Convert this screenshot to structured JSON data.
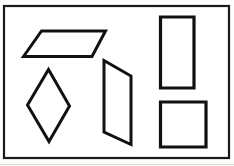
{
  "figure": {
    "background_color": "#fdfdfb",
    "paper_color": "#ffffff",
    "stroke_color": "#111111",
    "frame_stroke_color": "#1a1a1a",
    "canvas": {
      "width": 234,
      "height": 166
    },
    "frame": {
      "name": "border-frame",
      "x": 4,
      "y": 6,
      "width": 225,
      "height": 152,
      "stroke_width": 2.2
    },
    "shapes": [
      {
        "id": "parallelogram",
        "label": "Parallelogram",
        "stroke_width": 3.0,
        "points": "23.5,56.5 41.5,31.0 105.5,31.0 92.0,56.5"
      },
      {
        "id": "rhombus",
        "label": "Rhombus",
        "stroke_width": 3.0,
        "points": "48.5,69.5 69.5,106.0 49.0,141.5 27.5,105.0"
      },
      {
        "id": "slanted-quadrilateral",
        "label": "Slanted quadrilateral",
        "stroke_width": 3.0,
        "points": "104.0,60.5 131.0,76.0 131.0,144.5 104.0,132.0"
      },
      {
        "id": "tall-rectangle",
        "label": "Tall rectangle",
        "stroke_width": 3.2,
        "points": "160.5,17.0 194.0,17.0 194.0,88.0 160.5,88.0"
      },
      {
        "id": "square",
        "label": "Square",
        "stroke_width": 3.2,
        "points": "160.5,102.0 206.0,102.0 206.0,147.0 160.5,147.0"
      }
    ]
  },
  "chart_data": {
    "type": "diagram",
    "shape_count": 5,
    "shapes": [
      {
        "name": "parallelogram",
        "sides": 4,
        "vertices": [
          [
            23.5,
            56.5
          ],
          [
            41.5,
            31.0
          ],
          [
            105.5,
            31.0
          ],
          [
            92.0,
            56.5
          ]
        ]
      },
      {
        "name": "rhombus",
        "sides": 4,
        "vertices": [
          [
            48.5,
            69.5
          ],
          [
            69.5,
            106.0
          ],
          [
            49.0,
            141.5
          ],
          [
            27.5,
            105.0
          ]
        ]
      },
      {
        "name": "slanted-quadrilateral",
        "sides": 4,
        "vertices": [
          [
            104.0,
            60.5
          ],
          [
            131.0,
            76.0
          ],
          [
            131.0,
            144.5
          ],
          [
            104.0,
            132.0
          ]
        ]
      },
      {
        "name": "tall-rectangle",
        "sides": 4,
        "vertices": [
          [
            160.5,
            17.0
          ],
          [
            194.0,
            17.0
          ],
          [
            194.0,
            88.0
          ],
          [
            160.5,
            88.0
          ]
        ]
      },
      {
        "name": "square",
        "sides": 4,
        "vertices": [
          [
            160.5,
            102.0
          ],
          [
            206.0,
            102.0
          ],
          [
            206.0,
            147.0
          ],
          [
            160.5,
            147.0
          ]
        ]
      }
    ],
    "grid": false,
    "legend": false
  }
}
